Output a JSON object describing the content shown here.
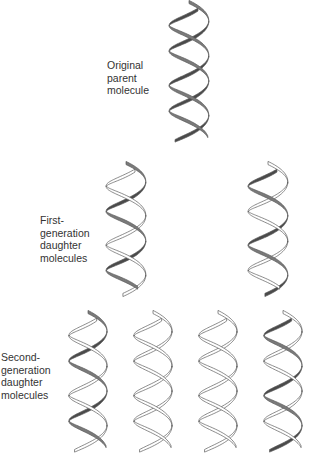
{
  "figure": {
    "labels": {
      "parent": [
        "Original",
        "parent",
        "molecule"
      ],
      "first_generation": [
        "First-",
        "generation",
        "daughter",
        "molecules"
      ],
      "second_generation": [
        "Second-",
        "generation",
        "daughter",
        "molecules"
      ]
    },
    "colors": {
      "old_strand": "#7a7a7a",
      "old_strand_dark": "#4a4a4a",
      "new_strand": "#ffffff",
      "outline": "#5a5a5a"
    },
    "helices": [
      {
        "id": "parent",
        "generation": 0,
        "x": 163,
        "y": 2,
        "width": 52,
        "height": 140,
        "turns": 2.2,
        "strand_a": "old",
        "strand_b": "old"
      },
      {
        "id": "gen1-left",
        "generation": 1,
        "x": 100,
        "y": 163,
        "width": 52,
        "height": 132,
        "turns": 2.1,
        "strand_a": "old",
        "strand_b": "new"
      },
      {
        "id": "gen1-right",
        "generation": 1,
        "x": 242,
        "y": 163,
        "width": 52,
        "height": 132,
        "turns": 2.1,
        "strand_a": "new",
        "strand_b": "old"
      },
      {
        "id": "gen2-1",
        "generation": 2,
        "x": 63,
        "y": 312,
        "width": 50,
        "height": 140,
        "turns": 2.2,
        "strand_a": "old",
        "strand_b": "new"
      },
      {
        "id": "gen2-2",
        "generation": 2,
        "x": 128,
        "y": 312,
        "width": 50,
        "height": 140,
        "turns": 2.2,
        "strand_a": "new",
        "strand_b": "new"
      },
      {
        "id": "gen2-3",
        "generation": 2,
        "x": 193,
        "y": 312,
        "width": 50,
        "height": 140,
        "turns": 2.2,
        "strand_a": "new",
        "strand_b": "new"
      },
      {
        "id": "gen2-4",
        "generation": 2,
        "x": 258,
        "y": 312,
        "width": 50,
        "height": 140,
        "turns": 2.2,
        "strand_a": "new",
        "strand_b": "old"
      }
    ]
  }
}
